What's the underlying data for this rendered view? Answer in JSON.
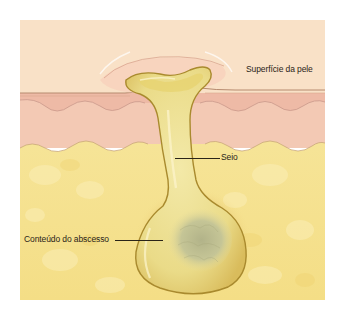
{
  "figure": {
    "labels": {
      "skin_surface": "Superfície da pele",
      "sinus": "Seio",
      "abscess_contents": "Conteúdo do abscesso"
    },
    "colors": {
      "epidermis": "#f8dfc4",
      "dermis": "#f2c8b4",
      "subcutaneous_fat": "#f5e08a",
      "abscess_wall": "#e8d476",
      "abscess_outline": "#b58a2a",
      "pus_core": "#bfbf8e",
      "label_text": "#2a2418"
    }
  }
}
